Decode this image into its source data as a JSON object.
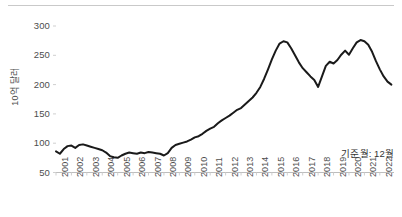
{
  "chart_data": {
    "type": "line",
    "title": "",
    "subtitle": "",
    "xlabel": "",
    "ylabel": "10억 달러",
    "ylim": [
      50,
      300
    ],
    "yticks": [
      50,
      100,
      150,
      200,
      250,
      300
    ],
    "ytick_labels": [
      "50",
      "100",
      "150",
      "200",
      "250",
      "300"
    ],
    "xlim": [
      2001,
      2022.92
    ],
    "xtick_labels": [
      "2001",
      "2002",
      "2003",
      "2004",
      "2005",
      "2006",
      "2007",
      "2008",
      "2009",
      "2010",
      "2011",
      "2012",
      "2013",
      "2014",
      "2015",
      "2016",
      "2017",
      "2018",
      "2019",
      "2020",
      "2021",
      "2022"
    ],
    "grid": false,
    "legend": null,
    "annotation": "기준월: 12월",
    "line_color": "#1a1a1a",
    "line_width": 2.0,
    "series": [
      {
        "name": "10억 달러",
        "x": [
          2001.0,
          2001.25,
          2001.5,
          2001.75,
          2002.0,
          2002.25,
          2002.5,
          2002.75,
          2003.0,
          2003.25,
          2003.5,
          2003.75,
          2004.0,
          2004.25,
          2004.5,
          2004.75,
          2005.0,
          2005.25,
          2005.5,
          2005.75,
          2006.0,
          2006.25,
          2006.5,
          2006.75,
          2007.0,
          2007.25,
          2007.5,
          2007.75,
          2008.0,
          2008.25,
          2008.5,
          2008.75,
          2009.0,
          2009.25,
          2009.5,
          2009.75,
          2010.0,
          2010.25,
          2010.5,
          2010.75,
          2011.0,
          2011.25,
          2011.5,
          2011.75,
          2012.0,
          2012.25,
          2012.5,
          2012.75,
          2013.0,
          2013.25,
          2013.5,
          2013.75,
          2014.0,
          2014.25,
          2014.5,
          2014.75,
          2015.0,
          2015.25,
          2015.5,
          2015.75,
          2016.0,
          2016.25,
          2016.5,
          2016.75,
          2017.0,
          2017.25,
          2017.5,
          2017.75,
          2018.0,
          2018.25,
          2018.5,
          2018.75,
          2019.0,
          2019.25,
          2019.5,
          2019.75,
          2020.0,
          2020.25,
          2020.5,
          2020.75,
          2021.0,
          2021.25,
          2021.5,
          2021.75,
          2022.0,
          2022.25,
          2022.5,
          2022.75
        ],
        "values": [
          86,
          82,
          90,
          95,
          96,
          92,
          97,
          98,
          96,
          94,
          92,
          90,
          88,
          84,
          78,
          76,
          75,
          79,
          82,
          84,
          83,
          82,
          84,
          83,
          85,
          84,
          83,
          82,
          79,
          83,
          92,
          97,
          99,
          101,
          103,
          106,
          110,
          112,
          116,
          121,
          125,
          128,
          134,
          139,
          143,
          147,
          152,
          157,
          160,
          166,
          172,
          178,
          186,
          196,
          210,
          226,
          243,
          258,
          270,
          274,
          272,
          262,
          250,
          238,
          228,
          221,
          214,
          208,
          196,
          214,
          232,
          239,
          236,
          242,
          251,
          258,
          251,
          262,
          272,
          276,
          274,
          268,
          256,
          240,
          226,
          214,
          205,
          200
        ]
      }
    ]
  },
  "axes": {
    "y_axis_name": "y-axis",
    "x_axis_name": "x-axis"
  }
}
